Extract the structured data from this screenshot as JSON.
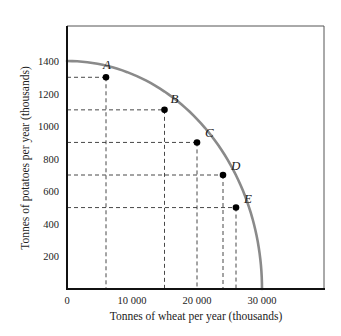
{
  "chart_data": {
    "type": "line",
    "title": "",
    "xlabel": "Tonnes of wheat per year (thousands)",
    "ylabel": "Tonnes of potatoes per year (thousands)",
    "xlim": [
      0,
      39000
    ],
    "ylim": [
      0,
      1600
    ],
    "x_ticks": [
      0,
      10000,
      20000,
      30000
    ],
    "x_tick_labels": [
      "0",
      "10 000",
      "20 000",
      "30 000"
    ],
    "y_ticks": [
      200,
      400,
      600,
      800,
      1000,
      1200,
      1400
    ],
    "y_tick_labels": [
      "200",
      "400",
      "600",
      "800",
      "1000",
      "1200",
      "1400"
    ],
    "grid": false,
    "legend": null,
    "series": [
      {
        "name": "Production possibility boundary",
        "color": "#8a8a8a",
        "x": [
          0,
          6000,
          15000,
          20000,
          24000,
          26000,
          30000
        ],
        "y": [
          1400,
          1300,
          1100,
          900,
          700,
          500,
          0
        ]
      }
    ],
    "points": [
      {
        "label": "A",
        "x": 6000,
        "y": 1300
      },
      {
        "label": "B",
        "x": 15000,
        "y": 1100
      },
      {
        "label": "C",
        "x": 20000,
        "y": 900
      },
      {
        "label": "D",
        "x": 24000,
        "y": 700
      },
      {
        "label": "E",
        "x": 26000,
        "y": 500
      }
    ],
    "annotations": "Dashed reference lines drop from each labelled point to both axes"
  },
  "colors": {
    "curve": "#8a8a8a",
    "axis": "#111111",
    "frame": "#555555",
    "dashed": "#333333",
    "point": "#000000"
  }
}
